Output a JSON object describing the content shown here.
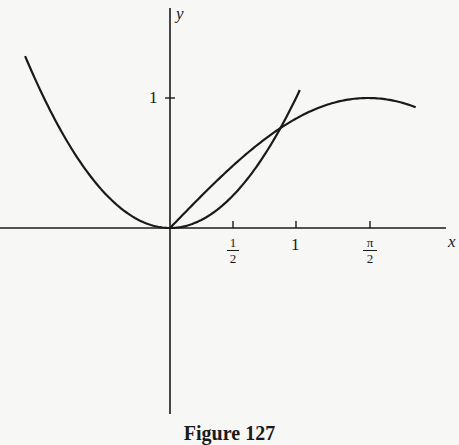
{
  "chart_data": {
    "type": "line",
    "title": "",
    "caption": "Figure 127",
    "xlabel": "x",
    "ylabel": "y",
    "x_ticks": [
      {
        "value": 0.5,
        "label": "1/2",
        "num": "1",
        "den": "2"
      },
      {
        "value": 1,
        "label": "1"
      },
      {
        "value": 1.5708,
        "label": "π/2",
        "num": "π",
        "den": "2"
      }
    ],
    "y_ticks": [
      {
        "value": 1,
        "label": "1"
      }
    ],
    "xlim": [
      -1.35,
      2.3
    ],
    "ylim": [
      -1.3,
      1.5
    ],
    "grid": false,
    "legend": null,
    "series": [
      {
        "name": "y = x^2",
        "x_range": [
          -1.15,
          1.03
        ],
        "points": [
          [
            -1.15,
            1.32
          ],
          [
            -0.5,
            0.25
          ],
          [
            0,
            0
          ],
          [
            0.5,
            0.25
          ],
          [
            0.877,
            0.769
          ],
          [
            1.03,
            1.06
          ]
        ]
      },
      {
        "name": "y = sin x",
        "x_range": [
          0,
          1.95
        ],
        "points": [
          [
            0,
            0
          ],
          [
            0.5,
            0.479
          ],
          [
            0.877,
            0.769
          ],
          [
            1,
            0.841
          ],
          [
            1.5708,
            1
          ],
          [
            1.95,
            0.929
          ]
        ]
      }
    ],
    "annotations": [
      {
        "text": "intersection",
        "x": 0.877,
        "y": 0.769
      }
    ]
  },
  "labels": {
    "x_axis": "x",
    "y_axis": "y",
    "y_one": "1",
    "x_half_num": "1",
    "x_half_den": "2",
    "x_one": "1",
    "x_pi_num": "π",
    "x_pi_den": "2",
    "caption": "Figure 127"
  }
}
